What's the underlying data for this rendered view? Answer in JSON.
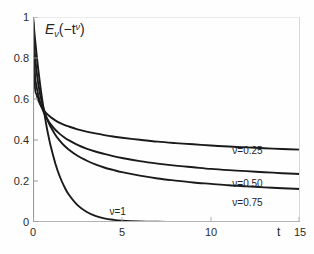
{
  "figure": {
    "background_color": "#fefefe",
    "axis_color": "#cfcfcf",
    "left_axis_color": "#8a8a8a",
    "curve_color": "#1a1a1a",
    "text_color": "#2b2b2b"
  },
  "title": {
    "base": "E",
    "sub": "ν",
    "arg_open": "(−t",
    "arg_sup": "ν",
    "arg_close": ")",
    "full": "Eν(−t^ν)"
  },
  "axes": {
    "x_name": "t",
    "y_name": "",
    "x_ticks": [
      "0",
      "5",
      "10",
      "15"
    ],
    "x_tick_values": [
      0,
      5,
      10,
      15
    ],
    "y_ticks": [
      "0",
      "0.2",
      "0.4",
      "0.6",
      "0.8",
      "1"
    ],
    "y_tick_values": [
      0,
      0.2,
      0.4,
      0.6,
      0.8,
      1
    ]
  },
  "curve_labels": [
    {
      "text": "ν=0.25",
      "x": 11.2,
      "y": 0.345
    },
    {
      "text": "ν=0.50",
      "x": 11.2,
      "y": 0.185
    },
    {
      "text": "ν=0.75",
      "x": 11.2,
      "y": 0.095
    },
    {
      "text": "ν=1",
      "x": 4.3,
      "y": 0.048
    }
  ],
  "chart_data": {
    "type": "line",
    "xlabel": "t",
    "ylabel": "",
    "xlim": [
      0,
      15
    ],
    "ylim": [
      0,
      1
    ],
    "grid": false,
    "legend": "inline-annotations",
    "x_ticks": [
      0,
      5,
      10,
      15
    ],
    "y_ticks": [
      0,
      0.2,
      0.4,
      0.6,
      0.8,
      1
    ],
    "x": [
      0,
      0.1,
      0.2,
      0.3,
      0.4,
      0.5,
      0.6,
      0.7,
      0.8,
      0.9,
      1,
      1.25,
      1.5,
      1.75,
      2,
      2.5,
      3,
      3.5,
      4,
      4.5,
      5,
      6,
      7,
      8,
      9,
      10,
      11,
      12,
      13,
      14,
      15
    ],
    "series": [
      {
        "name": "ν=0.25",
        "values": [
          1,
          0.672,
          0.622,
          0.594,
          0.574,
          0.558,
          0.546,
          0.535,
          0.526,
          0.518,
          0.511,
          0.496,
          0.484,
          0.474,
          0.466,
          0.452,
          0.441,
          0.432,
          0.424,
          0.417,
          0.411,
          0.401,
          0.392,
          0.385,
          0.379,
          0.373,
          0.368,
          0.364,
          0.36,
          0.356,
          0.353
        ]
      },
      {
        "name": "ν=0.50",
        "values": [
          1,
          0.732,
          0.662,
          0.617,
          0.584,
          0.558,
          0.536,
          0.518,
          0.502,
          0.488,
          0.476,
          0.45,
          0.43,
          0.413,
          0.399,
          0.376,
          0.358,
          0.344,
          0.332,
          0.321,
          0.312,
          0.297,
          0.285,
          0.275,
          0.267,
          0.259,
          0.253,
          0.248,
          0.243,
          0.238,
          0.234
        ]
      },
      {
        "name": "ν=0.75",
        "values": [
          1,
          0.828,
          0.736,
          0.672,
          0.623,
          0.584,
          0.552,
          0.525,
          0.501,
          0.481,
          0.463,
          0.426,
          0.397,
          0.373,
          0.354,
          0.323,
          0.3,
          0.281,
          0.266,
          0.254,
          0.243,
          0.226,
          0.212,
          0.202,
          0.193,
          0.186,
          0.179,
          0.174,
          0.169,
          0.165,
          0.161
        ]
      },
      {
        "name": "ν=1",
        "values": [
          1,
          0.905,
          0.819,
          0.741,
          0.67,
          0.607,
          0.549,
          0.497,
          0.449,
          0.407,
          0.368,
          0.287,
          0.223,
          0.174,
          0.135,
          0.082,
          0.05,
          0.03,
          0.018,
          0.011,
          0.0067,
          0.0025,
          0.0009,
          0.0003,
          0.0001,
          5e-05,
          2e-05,
          1e-05,
          0,
          0,
          0
        ]
      }
    ],
    "note": "Mittag-Leffler functions E_nu(-t^nu); curves all start at 1 and converge near t=0.7, y=0.47"
  }
}
